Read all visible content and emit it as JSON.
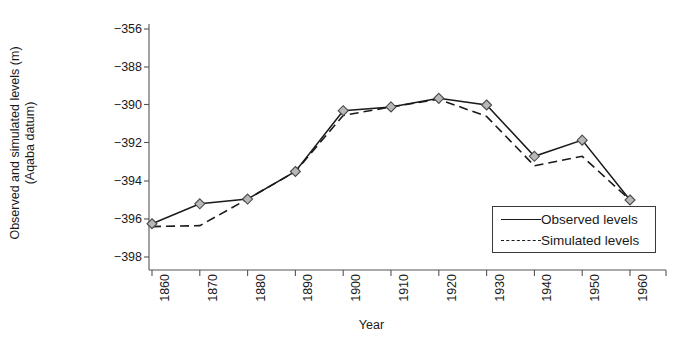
{
  "chart_data": {
    "type": "line",
    "title": "",
    "xlabel": "Year",
    "ylabel_line1": "Observed and simulated levels (m)",
    "ylabel_line2": "(Aqaba datum)",
    "x": [
      1860,
      1870,
      1880,
      1890,
      1900,
      1910,
      1920,
      1930,
      1940,
      1950,
      1960
    ],
    "xtick_labels": [
      "1860",
      "1870",
      "1880",
      "1890",
      "1900",
      "1910",
      "1920",
      "1930",
      "1940",
      "1950",
      "1960"
    ],
    "ytick_labels": [
      "-356",
      "-388",
      "-390",
      "-392",
      "-394",
      "-396",
      "-398"
    ],
    "ytick_values": [
      -386,
      -388,
      -390,
      -392,
      -394,
      -396,
      -398
    ],
    "ylim": [
      -398,
      -386
    ],
    "xlim": [
      1855,
      1965
    ],
    "grid": false,
    "legend_position": "bottom-right",
    "series": [
      {
        "name": "Observed levels",
        "style": "solid",
        "marker": "diamond",
        "values": [
          -396.25,
          -395.2,
          -394.95,
          -393.5,
          -390.3,
          -390.1,
          -389.65,
          -390.0,
          -392.7,
          -391.85,
          -395.0
        ]
      },
      {
        "name": "Simulated levels",
        "style": "dashed",
        "marker": "none",
        "values": [
          -396.4,
          -396.35,
          -394.95,
          -393.5,
          -390.55,
          -390.1,
          -389.7,
          -390.6,
          -393.2,
          -392.7,
          -395.0
        ]
      }
    ]
  },
  "legend": {
    "entries": [
      {
        "label": "Observed levels",
        "style": "solid"
      },
      {
        "label": "Simulated levels",
        "style": "dashed"
      }
    ]
  },
  "colors": {
    "line": "#1a1a1a",
    "axis": "#555555",
    "marker_fill": "#b8b8b8",
    "marker_stroke": "#4a4a4a",
    "background": "#ffffff"
  }
}
